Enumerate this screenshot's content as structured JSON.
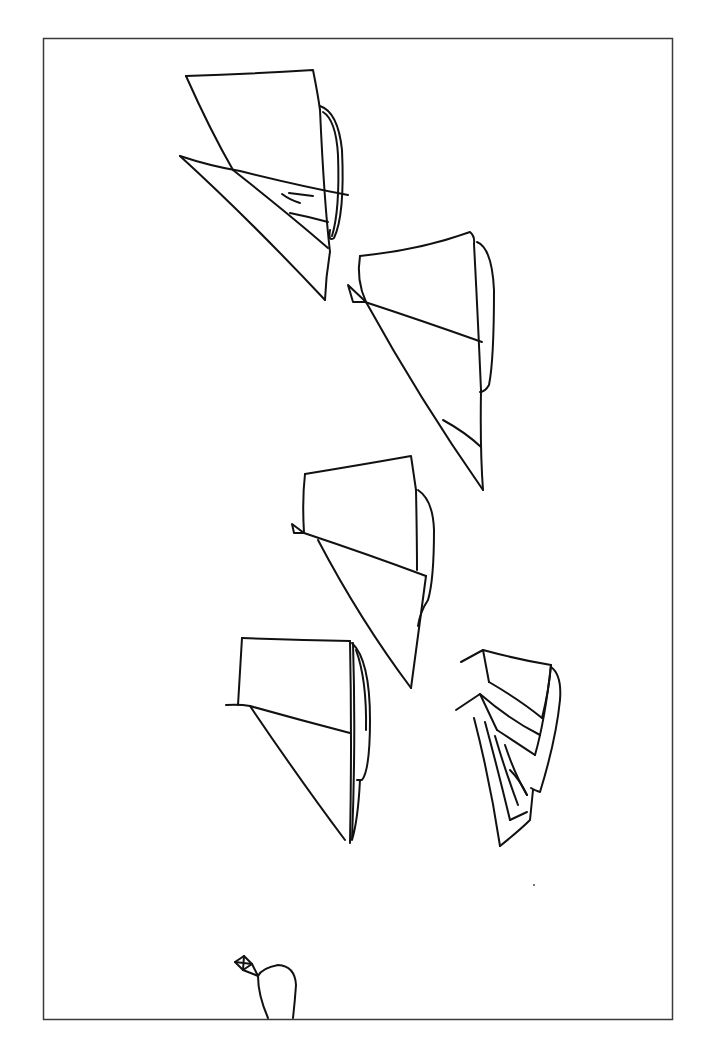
{
  "figure": {
    "title": "Line drawing of five sailboats",
    "colors": {
      "background": "#ffffff",
      "stroke": "#111111",
      "frame": "#3a3a3a"
    },
    "frame": {
      "x": 43,
      "y": 38,
      "width": 629,
      "height": 981
    },
    "elements": [
      {
        "id": "boat-1",
        "label": "Sailboat 1 (top left)"
      },
      {
        "id": "boat-2",
        "label": "Sailboat 2 (upper right)"
      },
      {
        "id": "boat-3",
        "label": "Sailboat 3 (middle)"
      },
      {
        "id": "boat-4",
        "label": "Sailboat 4 (lower left)"
      },
      {
        "id": "boat-5",
        "label": "Sailboat 5 (lower right, multi-sail)"
      },
      {
        "id": "kite-figure",
        "label": "Small kite and oval at bottom"
      }
    ]
  }
}
